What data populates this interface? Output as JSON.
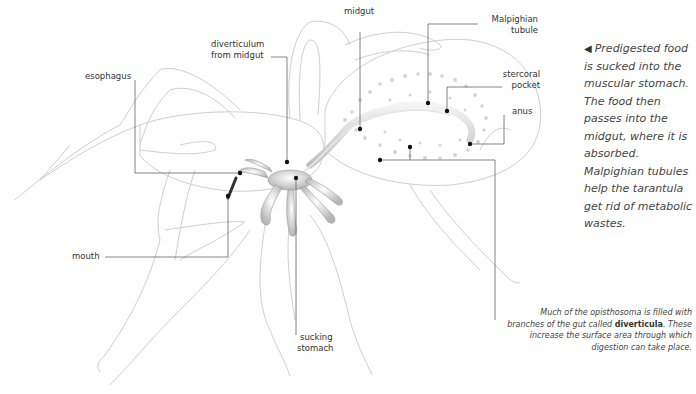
{
  "diagram": {
    "colors": {
      "outline": "#c8c8c8",
      "leader": "#555555",
      "dot": "#111111",
      "gut": "#d9d9d9"
    }
  },
  "labels": {
    "midgut": "midgut",
    "malpighian_1": "Malpighian",
    "malpighian_2": "tubule",
    "diverticulum_1": "diverticulum",
    "diverticulum_2": "from midgut",
    "esophagus": "esophagus",
    "stercoral_1": "stercoral",
    "stercoral_2": "pocket",
    "anus": "anus",
    "mouth": "mouth",
    "sucking_1": "sucking",
    "sucking_2": "stomach"
  },
  "caption": {
    "arrow": "◀",
    "text": "Predigested food is sucked into the muscular stomach. The food then passes into the midgut, where it is absorbed. Malpighian tubules help the tarantula get rid of metabolic wastes."
  },
  "note": {
    "before": "Much of the opisthosoma is filled with branches of the gut called ",
    "bold": "diverticula",
    "after": ". These increase the surface area through which digestion can take place."
  }
}
